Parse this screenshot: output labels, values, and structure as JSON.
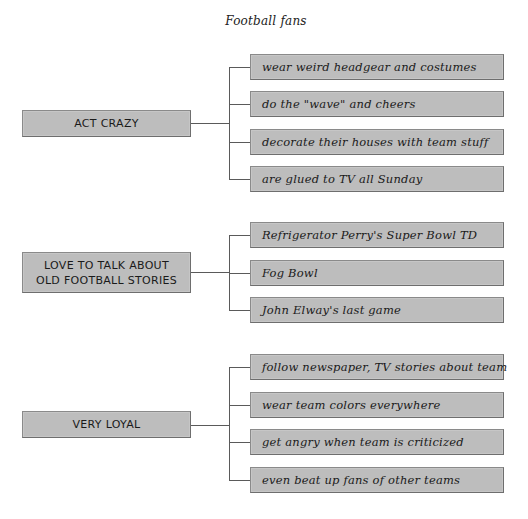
{
  "diagram": {
    "title": "Football fans",
    "groups": [
      {
        "label": "ACT CRAZY",
        "items": [
          "wear weird headgear and costumes",
          "do the \"wave\" and cheers",
          "decorate their houses with team stuff",
          "are glued to TV all Sunday"
        ]
      },
      {
        "label_line1": "LOVE TO TALK ABOUT",
        "label_line2": "OLD FOOTBALL STORIES",
        "items": [
          "Refrigerator Perry's Super Bowl TD",
          "Fog Bowl",
          "John Elway's last game"
        ]
      },
      {
        "label": "VERY LOYAL",
        "items": [
          "follow newspaper, TV stories about team",
          "wear team colors everywhere",
          "get angry when team is criticized",
          "even beat up fans of other teams"
        ]
      }
    ],
    "colors": {
      "box_fill": "#bdbdbd",
      "box_border": "#6e6e6e",
      "connector": "#5a5a5a",
      "text": "#1a1a1a"
    }
  }
}
